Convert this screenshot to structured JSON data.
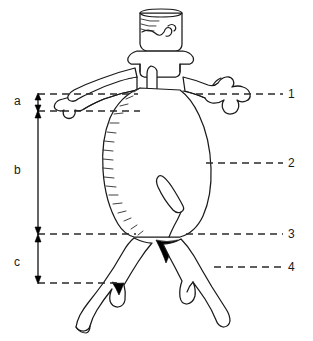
{
  "figure": {
    "type": "anatomical-line-drawing",
    "background_color": "#ffffff",
    "line_color": "#1a1a1a",
    "fill_color": "#000000",
    "width": 313,
    "height": 341
  },
  "numbered_labels": [
    {
      "id": "1",
      "text": "1",
      "x": 292,
      "y": 89,
      "leader_start_x": 196,
      "leader_end_x": 283,
      "leader_y": 94
    },
    {
      "id": "2",
      "text": "2",
      "x": 292,
      "y": 158,
      "leader_start_x": 206,
      "leader_end_x": 283,
      "leader_y": 163
    },
    {
      "id": "3",
      "text": "3",
      "x": 292,
      "y": 229,
      "leader_start_x": 186,
      "leader_end_x": 283,
      "leader_y": 234
    },
    {
      "id": "4",
      "text": "4",
      "x": 292,
      "y": 262,
      "leader_start_x": 214,
      "leader_end_x": 283,
      "leader_y": 267
    }
  ],
  "segment_labels": [
    {
      "id": "a",
      "text": "a",
      "x": 14,
      "y": 95
    },
    {
      "id": "b",
      "text": "b",
      "x": 14,
      "y": 164
    },
    {
      "id": "c",
      "text": "c",
      "x": 14,
      "y": 256
    }
  ],
  "measure_levels": [
    {
      "id": "level-top",
      "y": 94,
      "dash_start_x": 38,
      "dash_end_x": 283
    },
    {
      "id": "level-a-bottom",
      "y": 111,
      "dash_start_x": 38,
      "dash_end_x": 283
    },
    {
      "id": "level-b-bottom",
      "y": 234,
      "dash_start_x": 38,
      "dash_end_x": 283
    },
    {
      "id": "level-c-bottom",
      "y": 283,
      "dash_start_x": 38,
      "dash_end_x": 283
    }
  ],
  "measure_brackets": [
    {
      "id": "bracket-a",
      "label": "a",
      "top_y": 94,
      "bottom_y": 111,
      "x": 38
    },
    {
      "id": "bracket-b",
      "label": "b",
      "top_y": 111,
      "bottom_y": 234,
      "x": 38
    },
    {
      "id": "bracket-c",
      "label": "c",
      "top_y": 234,
      "bottom_y": 283,
      "x": 38
    }
  ]
}
